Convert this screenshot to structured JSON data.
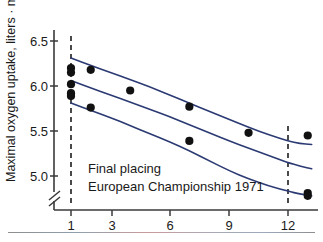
{
  "figure": {
    "background_color": "#ffffff",
    "line_color": "#2b3a73",
    "point_color": "#111111",
    "axis_color": "#3a3a3a"
  },
  "annotations": {
    "line1": "Final placing",
    "line2": "European Championship 1971"
  },
  "axes": {
    "y_title_main": "Maximal oxygen uptake, liters",
    "y_title_dot": "·",
    "y_title_unit": "min",
    "y_title_exp": "-1",
    "y_title_full": "Maximal oxygen uptake, liters · min⁻¹",
    "y_ticks": [
      "6.5",
      "6.0",
      "5.5",
      "5.0"
    ],
    "x_ticks": [
      "1",
      "3",
      "6",
      "9",
      "12"
    ],
    "y_axis_break": true
  },
  "chart_data": {
    "type": "scatter",
    "title": "",
    "xlabel": "Final placing European Championship 1971",
    "ylabel": "Maximal oxygen uptake, liters · min⁻¹",
    "xlim": [
      0.2,
      13.8
    ],
    "ylim": [
      4.72,
      6.62
    ],
    "ytick_values": [
      6.5,
      6.0,
      5.5,
      5.0
    ],
    "ytick_labels": [
      "6.5",
      "6.0",
      "5.5",
      "5.0"
    ],
    "xtick_values": [
      1,
      3,
      6,
      9,
      12
    ],
    "xtick_labels": [
      "1",
      "3",
      "6",
      "9",
      "12"
    ],
    "grid": false,
    "legend": "none",
    "points": [
      {
        "x": 1,
        "y": 6.2
      },
      {
        "x": 1,
        "y": 6.15
      },
      {
        "x": 1,
        "y": 6.02
      },
      {
        "x": 1,
        "y": 5.92
      },
      {
        "x": 1,
        "y": 5.89
      },
      {
        "x": 2,
        "y": 6.18
      },
      {
        "x": 2,
        "y": 5.76
      },
      {
        "x": 4,
        "y": 5.95
      },
      {
        "x": 7,
        "y": 5.77
      },
      {
        "x": 7,
        "y": 5.39
      },
      {
        "x": 10,
        "y": 5.48
      },
      {
        "x": 13,
        "y": 5.45
      },
      {
        "x": 13,
        "y": 4.81
      },
      {
        "x": 13,
        "y": 4.78
      }
    ],
    "series": [
      {
        "name": "upper confidence band",
        "type": "line",
        "x": [
          1.0,
          2.0,
          3.0,
          4.0,
          5.0,
          6.0,
          7.0,
          8.0,
          9.0,
          10.0,
          11.0,
          12.0,
          12.6,
          13.2
        ],
        "y": [
          6.31,
          6.23,
          6.15,
          6.07,
          5.99,
          5.9,
          5.81,
          5.72,
          5.63,
          5.54,
          5.46,
          5.39,
          5.36,
          5.35
        ]
      },
      {
        "name": "regression line",
        "type": "line",
        "x": [
          1.0,
          2.0,
          3.0,
          4.0,
          5.0,
          6.0,
          7.0,
          8.0,
          9.0,
          10.0,
          11.0,
          12.0,
          12.6,
          13.2
        ],
        "y": [
          6.06,
          5.98,
          5.9,
          5.82,
          5.74,
          5.66,
          5.57,
          5.48,
          5.39,
          5.31,
          5.23,
          5.15,
          5.11,
          5.08
        ]
      },
      {
        "name": "lower confidence band",
        "type": "line",
        "x": [
          1.0,
          2.0,
          3.0,
          4.0,
          5.0,
          6.0,
          7.0,
          8.0,
          9.0,
          10.0,
          11.0,
          12.0,
          12.6,
          13.2
        ],
        "y": [
          5.81,
          5.73,
          5.65,
          5.56,
          5.47,
          5.38,
          5.28,
          5.17,
          5.06,
          4.97,
          4.89,
          4.83,
          4.8,
          4.78
        ]
      }
    ],
    "reference_lines": [
      {
        "name": "dashed-reference-x1",
        "orientation": "vertical",
        "x": 1
      },
      {
        "name": "dashed-reference-x12",
        "orientation": "vertical",
        "x": 12
      }
    ]
  }
}
